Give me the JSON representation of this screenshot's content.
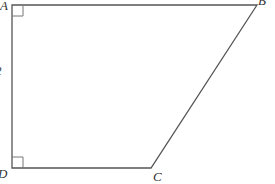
{
  "diagram": {
    "type": "trapezoid",
    "vertices": {
      "A": {
        "label": "A",
        "x": 12,
        "y": 5
      },
      "B": {
        "label": "B",
        "x": 257,
        "y": 5
      },
      "C": {
        "label": "C",
        "x": 151,
        "y": 168
      },
      "D": {
        "label": "D",
        "x": 12,
        "y": 168
      }
    },
    "side_label": "2",
    "right_angles": [
      "A",
      "D"
    ],
    "colors": {
      "stroke": "#555555",
      "text": "#333333",
      "background": "#ffffff"
    }
  }
}
